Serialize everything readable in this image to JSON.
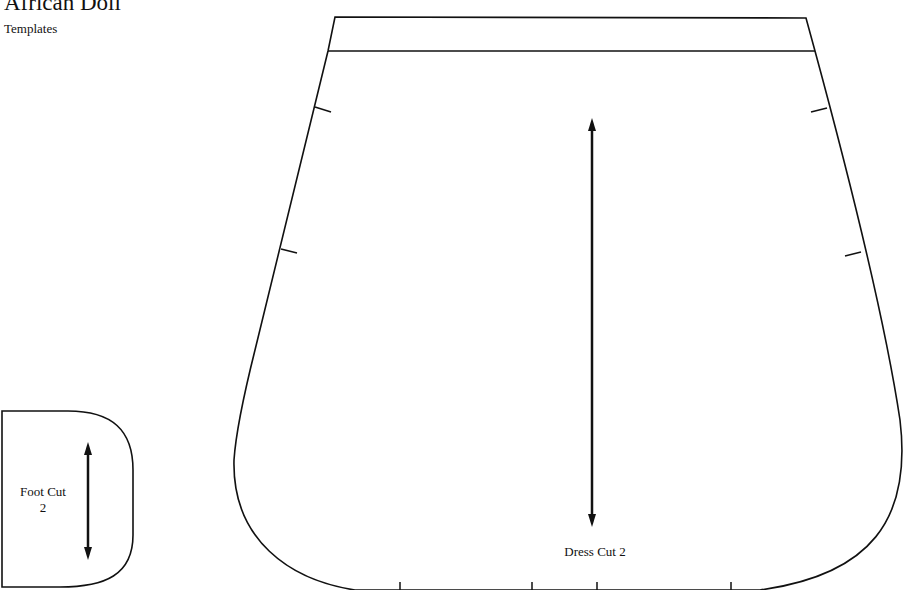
{
  "header": {
    "title": "African Doll",
    "subtitle": "Templates"
  },
  "pieces": [
    {
      "name": "Foot",
      "label_line1": "Foot Cut",
      "label_line2": "2",
      "grainline": "vertical-double-arrow"
    },
    {
      "name": "Dress",
      "label": "Dress Cut 2",
      "grainline": "vertical-double-arrow",
      "notches_left": 2,
      "notches_right": 2,
      "notches_bottom": 4
    }
  ],
  "colors": {
    "line": "#111111",
    "background": "#ffffff"
  }
}
